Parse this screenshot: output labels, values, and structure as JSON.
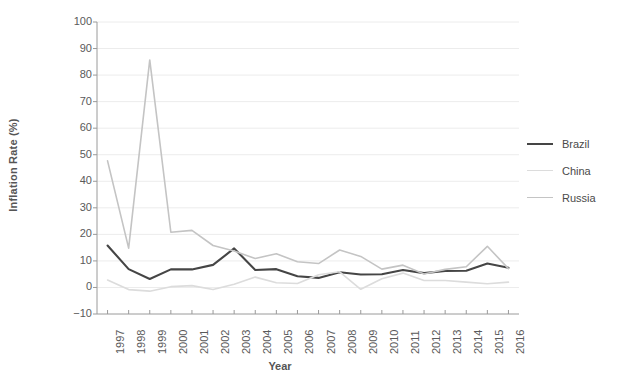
{
  "chart_data": {
    "type": "line",
    "title": "",
    "xlabel": "Year",
    "ylabel": "Inflation Rate (%)",
    "x": [
      1997,
      1998,
      1999,
      2000,
      2001,
      2002,
      2003,
      2004,
      2005,
      2006,
      2007,
      2008,
      2009,
      2010,
      2011,
      2012,
      2013,
      2014,
      2015,
      2016
    ],
    "categories": [
      "1997",
      "1998",
      "1999",
      "2000",
      "2001",
      "2002",
      "2003",
      "2004",
      "2005",
      "2006",
      "2007",
      "2008",
      "2009",
      "2010",
      "2011",
      "2012",
      "2013",
      "2014",
      "2015",
      "2016"
    ],
    "xlim": [
      1996.5,
      2016.5
    ],
    "ylim": [
      -10,
      100
    ],
    "yticks": [
      -10,
      0,
      10,
      20,
      30,
      40,
      50,
      60,
      70,
      80,
      90,
      100
    ],
    "ytick_labels": [
      "−10",
      "0",
      "10",
      "20",
      "30",
      "40",
      "50",
      "60",
      "70",
      "80",
      "90",
      "100"
    ],
    "grid": "horizontal",
    "legend_position": "right",
    "series": [
      {
        "name": "Brazil",
        "color": "#454545",
        "width": 2.1,
        "values": [
          15.8,
          6.9,
          3.2,
          6.8,
          6.8,
          8.5,
          14.7,
          6.6,
          6.9,
          4.2,
          3.6,
          5.7,
          4.9,
          5.0,
          6.6,
          5.4,
          6.2,
          6.3,
          9.0,
          7.4
        ]
      },
      {
        "name": "China",
        "color": "#dcdcdc",
        "width": 1.6,
        "values": [
          2.8,
          -0.8,
          -1.4,
          0.3,
          0.7,
          -0.8,
          1.2,
          3.9,
          1.8,
          1.5,
          4.8,
          5.9,
          -0.7,
          3.3,
          5.4,
          2.6,
          2.6,
          2.0,
          1.4,
          2.0
        ]
      },
      {
        "name": "Russia",
        "color": "#c4c4c4",
        "width": 1.6,
        "values": [
          47.7,
          14.8,
          85.7,
          20.8,
          21.5,
          15.8,
          13.7,
          10.9,
          12.7,
          9.7,
          9.0,
          14.1,
          11.7,
          6.9,
          8.4,
          5.1,
          6.8,
          7.8,
          15.5,
          7.1
        ]
      }
    ]
  },
  "legend": {
    "items": [
      {
        "label": "Brazil"
      },
      {
        "label": "China"
      },
      {
        "label": "Russia"
      }
    ]
  }
}
